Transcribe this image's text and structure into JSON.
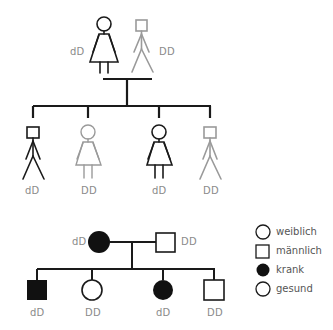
{
  "colors": {
    "black": "#1a1a1a",
    "grey": "#9a9a9a",
    "label": "#8a8a8a"
  },
  "top_pedigree": {
    "parents": [
      {
        "sex": "female",
        "style": "black",
        "genotype": "dD"
      },
      {
        "sex": "male",
        "style": "grey",
        "genotype": "DD"
      }
    ],
    "children": [
      {
        "sex": "male",
        "style": "black",
        "genotype": "dD"
      },
      {
        "sex": "female",
        "style": "grey",
        "genotype": "DD"
      },
      {
        "sex": "female",
        "style": "black",
        "genotype": "dD"
      },
      {
        "sex": "male",
        "style": "grey",
        "genotype": "DD"
      }
    ]
  },
  "bottom_pedigree": {
    "parents": [
      {
        "sex": "female",
        "affected": true,
        "genotype": "dD"
      },
      {
        "sex": "male",
        "affected": false,
        "genotype": "DD"
      }
    ],
    "children": [
      {
        "sex": "male",
        "affected": true,
        "genotype": "dD"
      },
      {
        "sex": "female",
        "affected": false,
        "genotype": "DD"
      },
      {
        "sex": "female",
        "affected": true,
        "genotype": "dD"
      },
      {
        "sex": "male",
        "affected": false,
        "genotype": "DD"
      }
    ]
  },
  "legend": {
    "items": [
      {
        "symbol": "circle-outline",
        "label": "weiblich"
      },
      {
        "symbol": "square-outline",
        "label": "männlich"
      },
      {
        "symbol": "circle-filled",
        "label": "krank"
      },
      {
        "symbol": "circle-outline",
        "label": "gesund"
      }
    ]
  }
}
